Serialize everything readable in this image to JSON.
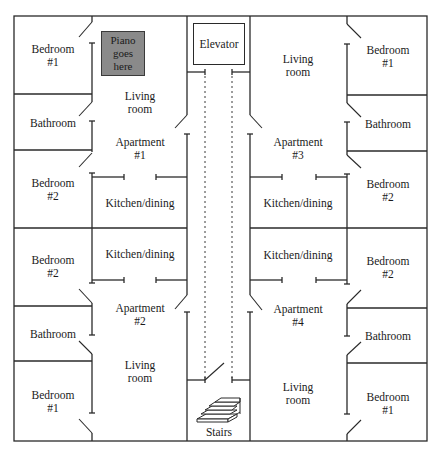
{
  "diagram": {
    "type": "floor-plan",
    "colors": {
      "wall": "#2a2a2a",
      "piano": "#8a8a8a",
      "background": "#ffffff"
    },
    "core": {
      "elevator_label": "Elevator",
      "stairs_label": "Stairs"
    },
    "piano": {
      "line1": "Piano",
      "line2": "goes",
      "line3": "here"
    },
    "apartments": [
      {
        "id": "1",
        "title_line1": "Apartment",
        "title_line2": "#1",
        "rooms": {
          "bedroom1": [
            "Bedroom",
            "#1"
          ],
          "bathroom": "Bathroom",
          "bedroom2": [
            "Bedroom",
            "#2"
          ],
          "living": [
            "Living",
            "room"
          ],
          "kitchen": "Kitchen/dining"
        }
      },
      {
        "id": "2",
        "title_line1": "Apartment",
        "title_line2": "#2",
        "rooms": {
          "bedroom1": [
            "Bedroom",
            "#1"
          ],
          "bathroom": "Bathroom",
          "bedroom2": [
            "Bedroom",
            "#2"
          ],
          "living": [
            "Living",
            "room"
          ],
          "kitchen": "Kitchen/dining"
        }
      },
      {
        "id": "3",
        "title_line1": "Apartment",
        "title_line2": "#3",
        "rooms": {
          "bedroom1": [
            "Bedroom",
            "#1"
          ],
          "bathroom": "Bathroom",
          "bedroom2": [
            "Bedroom",
            "#2"
          ],
          "living": [
            "Living",
            "room"
          ],
          "kitchen": "Kitchen/dining"
        }
      },
      {
        "id": "4",
        "title_line1": "Apartment",
        "title_line2": "#4",
        "rooms": {
          "bedroom1": [
            "Bedroom",
            "#1"
          ],
          "bathroom": "Bathroom",
          "bedroom2": [
            "Bedroom",
            "#2"
          ],
          "living": [
            "Living",
            "room"
          ],
          "kitchen": "Kitchen/dining"
        }
      }
    ]
  }
}
